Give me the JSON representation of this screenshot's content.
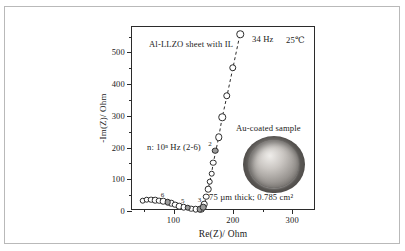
{
  "figure": {
    "annotations": {
      "sample_title": "Al-LLZO sheet with IL",
      "temperature": "25℃",
      "freq_marker": "34 Hz",
      "decade_note": "n: 10ⁿ Hz (2-6)",
      "inset_title": "Au-coated sample",
      "inset_caption": "75 µm thick; 0.785 cm²"
    },
    "icons": {
      "inset_photo": "gold-coated-disc-photo"
    }
  },
  "chart_data": {
    "type": "scatter",
    "title": "Al-LLZO sheet with IL",
    "xlabel": "Re(Z)/ Ohm",
    "ylabel": "-Im(Z)/ Ohm",
    "xlim": [
      30,
      340
    ],
    "ylim": [
      0,
      580
    ],
    "xticks": [
      100,
      200,
      300
    ],
    "xtick_labels": [
      "100",
      "200",
      "300"
    ],
    "xminor": [
      50,
      150,
      250
    ],
    "yticks": [
      0,
      100,
      200,
      300,
      400,
      500
    ],
    "ytick_labels": [
      "0",
      "100",
      "200",
      "300",
      "400",
      "500"
    ],
    "yminor": [
      50,
      150,
      250,
      350,
      450,
      550
    ],
    "grid": false,
    "legend": "none",
    "connector": "dashed-line",
    "series": [
      {
        "name": "Impedance spectrum (open markers)",
        "marker": "open-circle",
        "points": [
          {
            "x": 48,
            "y": 33
          },
          {
            "x": 55,
            "y": 35
          },
          {
            "x": 62,
            "y": 35
          },
          {
            "x": 69,
            "y": 34
          },
          {
            "x": 76,
            "y": 32
          },
          {
            "x": 83,
            "y": 30
          },
          {
            "x": 96,
            "y": 24
          },
          {
            "x": 103,
            "y": 20
          },
          {
            "x": 110,
            "y": 16
          },
          {
            "x": 117,
            "y": 12
          },
          {
            "x": 130,
            "y": 7
          },
          {
            "x": 137,
            "y": 5
          },
          {
            "x": 147,
            "y": 6
          },
          {
            "x": 152,
            "y": 22
          },
          {
            "x": 155,
            "y": 45
          },
          {
            "x": 158,
            "y": 68
          },
          {
            "x": 161,
            "y": 92
          },
          {
            "x": 164,
            "y": 118
          },
          {
            "x": 167,
            "y": 152
          },
          {
            "x": 176,
            "y": 232
          },
          {
            "x": 182,
            "y": 295
          },
          {
            "x": 190,
            "y": 363
          },
          {
            "x": 200,
            "y": 451
          },
          {
            "x": 212,
            "y": 557
          }
        ]
      },
      {
        "name": "Decade frequency markers (filled markers)",
        "marker": "filled-circle",
        "points": [
          {
            "x": 90,
            "y": 27,
            "label": "6"
          },
          {
            "x": 124,
            "y": 10,
            "label": "5"
          },
          {
            "x": 144,
            "y": 5,
            "label": "4"
          },
          {
            "x": 170,
            "y": 190,
            "label": "2"
          }
        ]
      },
      {
        "name": "Unlabeled decade marker",
        "marker": "filled-circle",
        "points": [
          {
            "x": 150,
            "y": 12,
            "label": "3"
          }
        ]
      }
    ],
    "point_labels": [
      {
        "text": "6",
        "x": 90,
        "y": 27
      },
      {
        "text": "5",
        "x": 124,
        "y": 10
      },
      {
        "text": "3",
        "x": 152,
        "y": 14
      },
      {
        "text": "2",
        "x": 170,
        "y": 190
      }
    ]
  }
}
